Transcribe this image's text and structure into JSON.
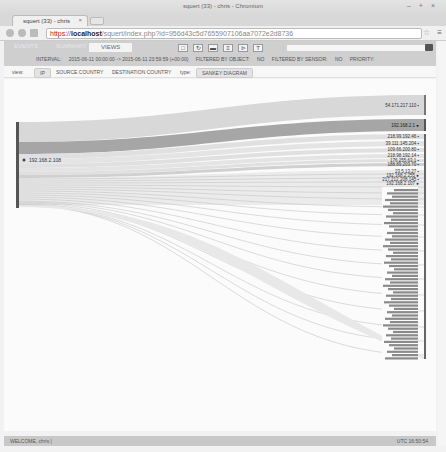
{
  "window": {
    "title": "squert (33) - chris - Chromium",
    "controls": "– + ×"
  },
  "tab": {
    "label": "squert (33) - chris",
    "close": "×"
  },
  "address": {
    "scheme": "https://",
    "host": "localhost",
    "path": "/squert/index.php?id=956d43c5d7655907106aa7072e2d8736"
  },
  "app": {
    "tabs": [
      {
        "label": "EVENTS"
      },
      {
        "label": "SUMMARY"
      },
      {
        "label": "VIEWS"
      }
    ],
    "toolbar_icons": [
      "square-icon",
      "refresh-icon",
      "comment-icon",
      "list-icon",
      "tree-icon",
      "filter-icon"
    ],
    "toolbar_glyphs": [
      "□",
      "↻",
      "▬",
      "≡",
      "⊳",
      "T"
    ],
    "interval_label": "INTERVAL:",
    "interval_value": "2015-06-11 00:00:00 -> 2015-06-11 23:59:59 (+00:00)",
    "filtered_object_label": "FILTERED BY OBJECT:",
    "filtered_object_value": "NO",
    "filtered_sensor_label": "FILTERED BY SENSOR:",
    "filtered_sensor_value": "NO",
    "priority_label": "PRIORITY:"
  },
  "subbar": {
    "view_label": "view:",
    "view_options": [
      "IP",
      "SOURCE COUNTRY",
      "DESTINATION COUNTRY"
    ],
    "type_label": "type:",
    "type_value": "SANKEY DIAGRAM"
  },
  "sankey": {
    "source": {
      "label": "192.168.2.108",
      "flag": "●"
    },
    "targets": [
      {
        "label": "54.171.217.110 ▪",
        "y": 16,
        "h": 20,
        "dark": false
      },
      {
        "label": "192.168.2.1 ●",
        "y": 40,
        "h": 12,
        "dark": true
      },
      {
        "label": "218.99.192.46 ▪",
        "y": 55,
        "h": 5
      },
      {
        "label": "39.111.145.204 ▪",
        "y": 62,
        "h": 5
      },
      {
        "label": "109.66.200.80 ▪",
        "y": 69,
        "h": 4
      },
      {
        "label": "218.98.192.14 ▪",
        "y": 75,
        "h": 4
      },
      {
        "label": "176.255.63.1 ▪",
        "y": 80,
        "h": 3
      },
      {
        "label": "188.89.203.70 ▪",
        "y": 84,
        "h": 3
      },
      {
        "label": "23.5.13.27 ▪",
        "y": 91,
        "h": 2
      },
      {
        "label": "192.168.2.255 ●",
        "y": 95,
        "h": 2
      },
      {
        "label": "217.212.208.145 ▪",
        "y": 99,
        "h": 2
      },
      {
        "label": "192.168.2.107 ●",
        "y": 103,
        "h": 2
      }
    ],
    "small_target_count": 52
  },
  "status": {
    "welcome": "WELCOME, chris |",
    "time": "UTC 16:50:54"
  }
}
